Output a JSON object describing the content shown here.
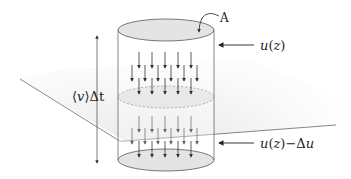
{
  "diagram": {
    "type": "flux-cylinder",
    "labels": {
      "area": "A",
      "upper_velocity": "u(z)",
      "lower_velocity": "u(z)−Δu",
      "height": "⟨v⟩Δt"
    },
    "label_parts": {
      "upper_u": "u",
      "upper_paren_open": "(",
      "upper_z": "z",
      "upper_paren_close": ")",
      "lower_u": "u",
      "lower_paren_open": "(",
      "lower_z": "z",
      "lower_paren_close": ")",
      "lower_minus": "−",
      "lower_delta": "Δ",
      "lower_u2": "u",
      "height_open": "⟨",
      "height_v": "v",
      "height_close": "⟩",
      "height_delta_t": "Δt"
    },
    "colors": {
      "stroke": "#333333",
      "cap_fill": "#e4e4e4",
      "plane_fill": "#e9e9e9",
      "arrow_upper": "#333333",
      "arrow_lower": "#555555",
      "dashed": "#9a9a9a"
    }
  }
}
